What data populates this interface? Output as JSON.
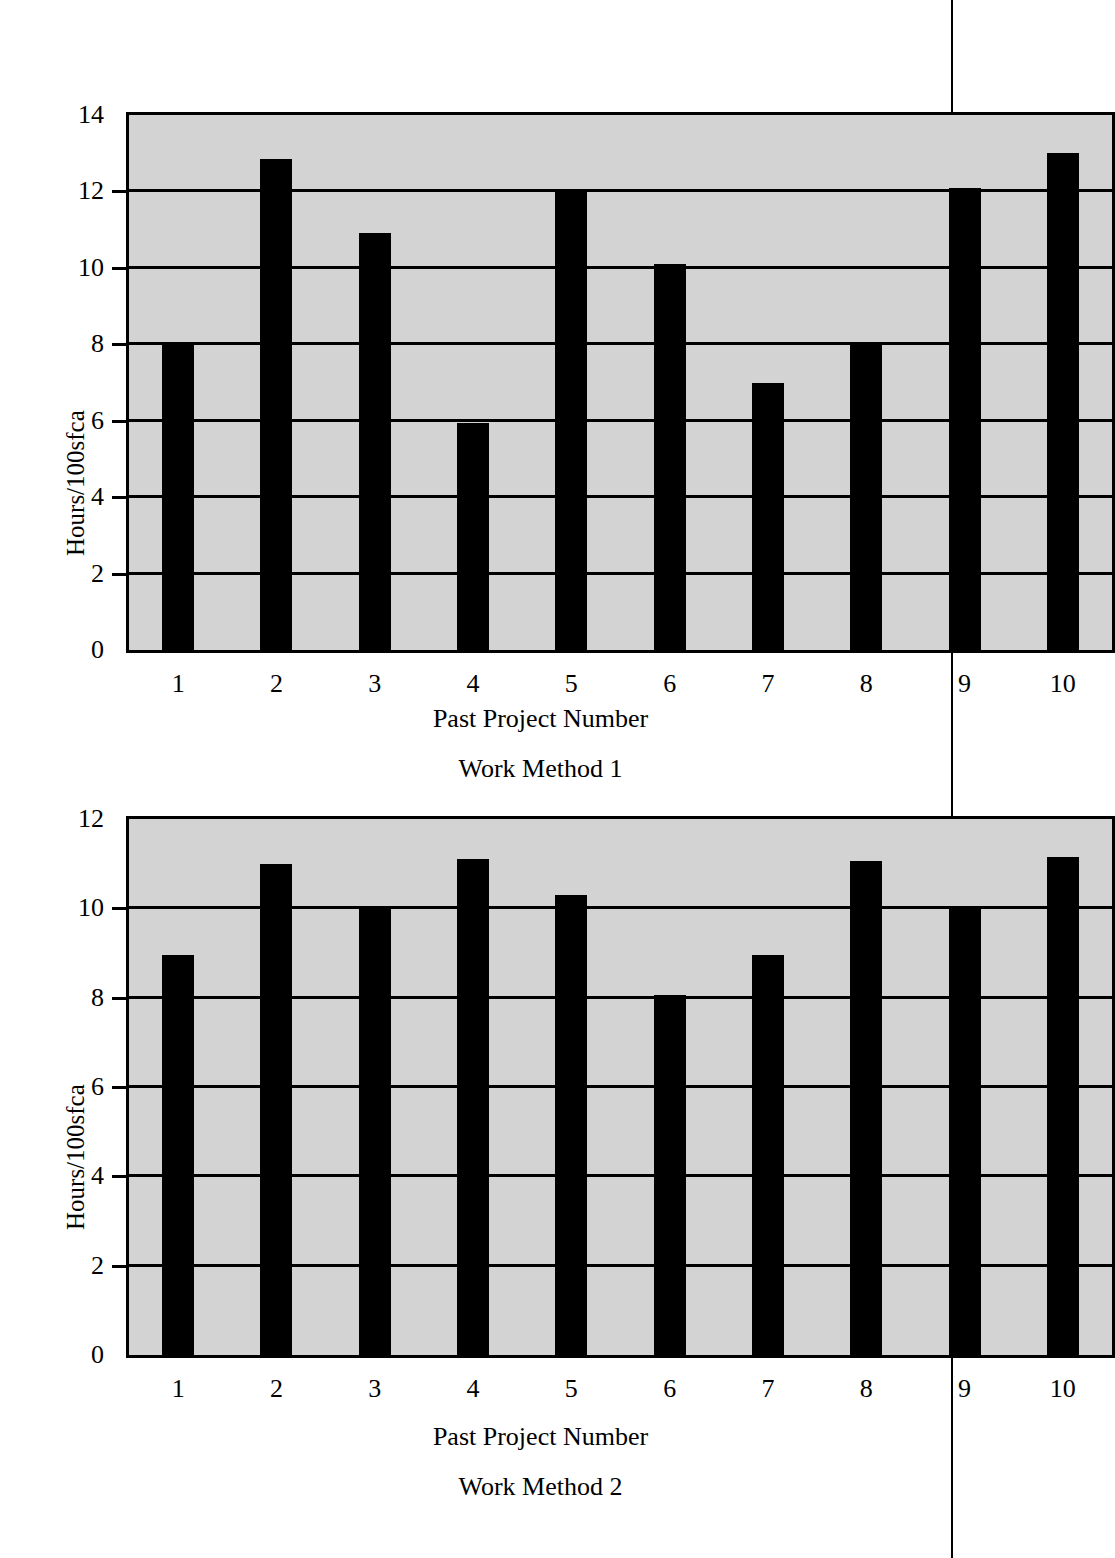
{
  "page": {
    "rule_label": "page-margin-rule"
  },
  "chart_data": [
    {
      "type": "bar",
      "id": "work-method-1",
      "title": "",
      "xlabel": "Past Project Number",
      "sublabel": "Work Method 1",
      "ylabel": "Hours/100sfca",
      "categories": [
        "1",
        "2",
        "3",
        "4",
        "5",
        "6",
        "7",
        "8",
        "9",
        "10"
      ],
      "values": [
        8.0,
        12.85,
        10.9,
        5.95,
        12.05,
        10.1,
        7.0,
        8.05,
        12.1,
        13.0
      ],
      "ylim": [
        0,
        14
      ],
      "yticks": [
        0,
        2,
        4,
        6,
        8,
        10,
        12,
        14
      ],
      "ytick_labels": [
        "0",
        "2",
        "4",
        "6",
        "8",
        "10",
        "12",
        "14"
      ],
      "grid": true,
      "legend": "none",
      "bar_color": "#000000",
      "plot_bg": "#d3d3d3"
    },
    {
      "type": "bar",
      "id": "work-method-2",
      "title": "",
      "xlabel": "Past Project Number",
      "sublabel": "Work Method 2",
      "ylabel": "Hours/100sfca",
      "categories": [
        "1",
        "2",
        "3",
        "4",
        "5",
        "6",
        "7",
        "8",
        "9",
        "10"
      ],
      "values": [
        8.95,
        11.0,
        10.0,
        11.1,
        10.3,
        8.05,
        8.95,
        11.05,
        10.05,
        11.15
      ],
      "ylim": [
        0,
        12
      ],
      "yticks": [
        0,
        2,
        4,
        6,
        8,
        10,
        12
      ],
      "ytick_labels": [
        "0",
        "2",
        "4",
        "6",
        "8",
        "10",
        "12"
      ],
      "grid": true,
      "legend": "none",
      "bar_color": "#000000",
      "plot_bg": "#d3d3d3"
    }
  ]
}
